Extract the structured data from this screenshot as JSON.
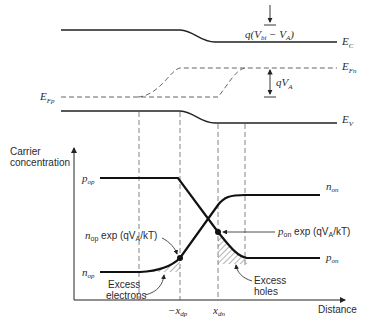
{
  "band_diagram": {
    "ec_label": "E",
    "ec_sub": "C",
    "efn_label": "E",
    "efn_sub": "Fn",
    "efp_label": "E",
    "efp_sub": "Fp",
    "ev_label": "E",
    "ev_sub": "V",
    "barrier_label_pre": "q(V",
    "barrier_label_sub": "bi",
    "barrier_label_post": " − V",
    "barrier_label_sub2": "A",
    "barrier_label_end": ")",
    "qva_label": "qV",
    "qva_sub": "A"
  },
  "carrier_plot": {
    "ylabel_line1": "Carrier",
    "ylabel_line2": "concentration",
    "xlabel": "Distance",
    "pop_label": "p",
    "pop_sub": "op",
    "nop_label": "n",
    "nop_sub": "op",
    "non_label": "n",
    "non_sub": "on",
    "pon_label": "p",
    "pon_sub": "on",
    "nop_exp_label_sym": "n",
    "nop_exp_label_sub": "op",
    "nop_exp_label_rest": " exp (qV",
    "nop_exp_label_sub2": "A",
    "nop_exp_label_end": "/kT)",
    "pon_exp_label_sym": "p",
    "pon_exp_label_sub": "on",
    "pon_exp_label_rest": " exp (qV",
    "pon_exp_label_sub2": "A",
    "pon_exp_label_end": "/kT)",
    "excess_electrons_line1": "Excess",
    "excess_electrons_line2": "electrons",
    "excess_holes_line1": "Excess",
    "excess_holes_line2": "holes",
    "xdp_label": "−x",
    "xdp_sub": "dp",
    "xdn_label": "x",
    "xdn_sub": "dn"
  }
}
